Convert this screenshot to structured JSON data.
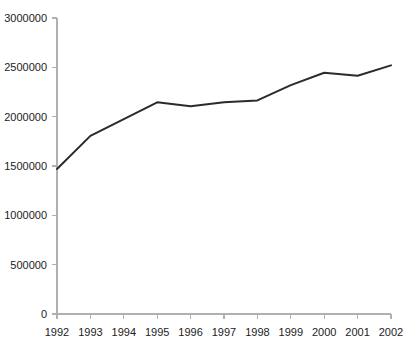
{
  "chart_data": {
    "type": "line",
    "title": "",
    "subtitle": "",
    "xlabel": "",
    "ylabel": "",
    "x": [
      1992,
      1993,
      1994,
      1995,
      1996,
      1997,
      1998,
      1999,
      2000,
      2001,
      2002
    ],
    "categories": [
      "1992",
      "1993",
      "1994",
      "1995",
      "1996",
      "1997",
      "1998",
      "1999",
      "2000",
      "2001",
      "2002"
    ],
    "series": [
      {
        "name": "",
        "values": [
          1470000,
          1805000,
          1975000,
          2145000,
          2105000,
          2145000,
          2165000,
          2320000,
          2445000,
          2415000,
          2520000
        ]
      }
    ],
    "xlim": [
      1992,
      2002
    ],
    "ylim": [
      0,
      3000000
    ],
    "ytick_values": [
      0,
      500000,
      1000000,
      1500000,
      2000000,
      2500000,
      3000000
    ],
    "ytick_labels": [
      "0",
      "500000",
      "1000000",
      "1500000",
      "2000000",
      "2500000",
      "3000000"
    ],
    "xtick_labels": [
      "1992",
      "1993",
      "1994",
      "1995",
      "1996",
      "1997",
      "1998",
      "1999",
      "2000",
      "2001",
      "2002"
    ],
    "grid": false,
    "legend": false,
    "legend_position": "none",
    "line_color": "#2b2b2b",
    "axis_color": "#b0b0b0",
    "background_color": "#ffffff",
    "annotations": []
  }
}
